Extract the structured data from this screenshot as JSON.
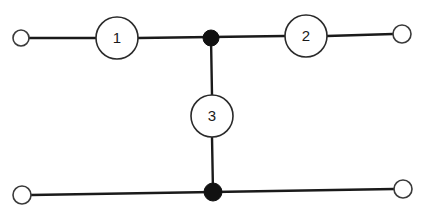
{
  "diagram": {
    "type": "two-port network",
    "elements": [
      {
        "id": "1",
        "label": "1",
        "cx": 117,
        "cy": 38,
        "r": 21
      },
      {
        "id": "2",
        "label": "2",
        "cx": 306,
        "cy": 36,
        "r": 21
      },
      {
        "id": "3",
        "label": "3",
        "cx": 212,
        "cy": 116,
        "r": 21
      }
    ],
    "terminals": [
      {
        "id": "top-left",
        "cx": 21,
        "cy": 38,
        "r": 8
      },
      {
        "id": "top-right",
        "cx": 402,
        "cy": 34,
        "r": 9
      },
      {
        "id": "bottom-left",
        "cx": 22,
        "cy": 195,
        "r": 9
      },
      {
        "id": "bottom-right",
        "cx": 403,
        "cy": 189,
        "r": 9
      }
    ],
    "junctions": [
      {
        "id": "top",
        "cx": 211,
        "cy": 38,
        "r": 8
      },
      {
        "id": "bottom",
        "cx": 213,
        "cy": 192,
        "r": 9
      }
    ],
    "colors": {
      "line": "#1a1a1a",
      "junction_fill": "#111111",
      "background": "#ffffff"
    }
  }
}
